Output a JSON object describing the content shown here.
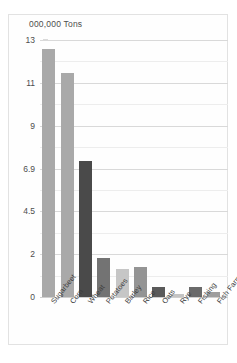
{
  "chart_data": {
    "type": "bar",
    "title": "000,000 Tons",
    "xlabel": "",
    "ylabel": "",
    "categories": [
      "Sugarbeet",
      "Corn",
      "Wheat",
      "Potatoes",
      "Barley",
      "Rice",
      "Oats",
      "Rye",
      "Fishing",
      "Fish Farming"
    ],
    "values": [
      12.6,
      11.45,
      7.25,
      1.8,
      1.3,
      1.4,
      0.45,
      0.15,
      0.45,
      0.25
    ],
    "bar_colors": [
      "#a9a9a9",
      "#a9a9a9",
      "#4a4a4a",
      "#737373",
      "#c6c6c6",
      "#949494",
      "#5a5a5a",
      "#c4c4c4",
      "#6a6a6a",
      "#9e9e9e"
    ],
    "ytick_labels": [
      "13",
      "11",
      "9",
      "6.9",
      "4.5",
      "2",
      "0"
    ],
    "ytick_positions": [
      13,
      11,
      9,
      6.9,
      4.5,
      2,
      0
    ],
    "ylim": [
      0,
      13.7
    ],
    "grid": true,
    "legend": "none"
  },
  "axis": {
    "y_label_13": "13",
    "y_label_11": "11",
    "y_label_9": "9",
    "y_label_69": "6.9",
    "y_label_45": "4.5",
    "y_label_2": "2",
    "y_label_0": "0"
  },
  "categories": {
    "c0": "Sugarbeet",
    "c1": "Corn",
    "c2": "Wheat",
    "c3": "Potatoes",
    "c4": "Barley",
    "c5": "Rice",
    "c6": "Oats",
    "c7": "Rye",
    "c8": "Fishing",
    "c9": "Fish Farming"
  }
}
